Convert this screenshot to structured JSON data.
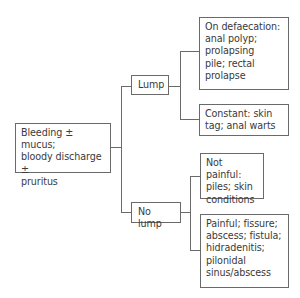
{
  "diagram": {
    "root": {
      "label": "Bleeding ± mucus;\nbloody discharge ±\npruritus"
    },
    "branches": [
      {
        "label": "Lump",
        "children": [
          {
            "label": "On defaecation:\nanal polyp;\nprolapsing\npile; rectal\nprolapse"
          },
          {
            "label": "Constant: skin\ntag; anal warts"
          }
        ]
      },
      {
        "label": "No lump",
        "children": [
          {
            "label": "Not painful:\npiles; skin\nconditions"
          },
          {
            "label": "Painful; fissure;\nabscess; fistula;\nhidradenitis;\npilonidal\nsinus/abscess"
          }
        ]
      }
    ],
    "colors": {
      "line": "#6a6a6a",
      "text": "#3a3a3a",
      "background": "#ffffff"
    }
  }
}
